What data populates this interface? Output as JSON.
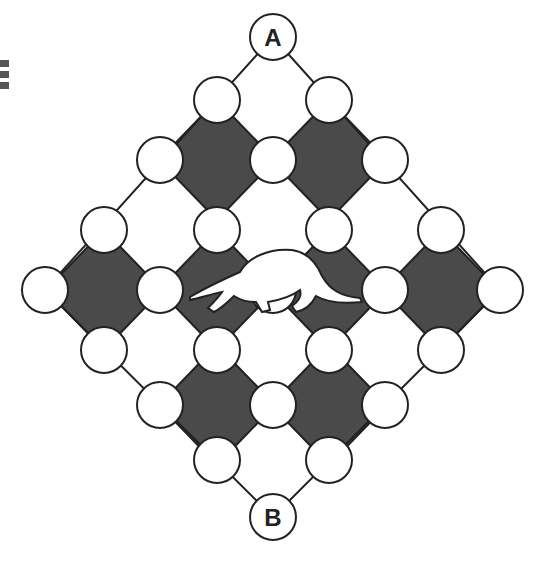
{
  "menu": {
    "icon": "hamburger-menu-icon"
  },
  "board": {
    "colors": {
      "dark_cell": "#4a4a4a",
      "stroke": "#222222",
      "node_fill": "#ffffff",
      "background": "#ffffff"
    },
    "node_radius": 23,
    "start_label": "A",
    "end_label": "B",
    "start_node": {
      "x": 273,
      "y": 37
    },
    "end_node": {
      "x": 273,
      "y": 517
    },
    "outline": [
      [
        273,
        37
      ],
      [
        45,
        290
      ],
      [
        273,
        517
      ],
      [
        500,
        290
      ]
    ],
    "dark_cells": [
      [
        217,
        160
      ],
      [
        329,
        160
      ],
      [
        104,
        290
      ],
      [
        217,
        290
      ],
      [
        329,
        290
      ],
      [
        441,
        290
      ],
      [
        217,
        405
      ],
      [
        329,
        405
      ]
    ],
    "nodes": [
      [
        217,
        100
      ],
      [
        329,
        100
      ],
      [
        160,
        160
      ],
      [
        273,
        160
      ],
      [
        385,
        160
      ],
      [
        104,
        230
      ],
      [
        217,
        230
      ],
      [
        329,
        230
      ],
      [
        441,
        230
      ],
      [
        45,
        290
      ],
      [
        160,
        290
      ],
      [
        273,
        290
      ],
      [
        385,
        290
      ],
      [
        500,
        290
      ],
      [
        104,
        350
      ],
      [
        217,
        350
      ],
      [
        329,
        350
      ],
      [
        441,
        350
      ],
      [
        160,
        405
      ],
      [
        273,
        405
      ],
      [
        385,
        405
      ],
      [
        217,
        460
      ],
      [
        329,
        460
      ]
    ],
    "creature": {
      "name": "anteater",
      "icon": "anteater-icon",
      "x": 273,
      "y": 290
    }
  }
}
